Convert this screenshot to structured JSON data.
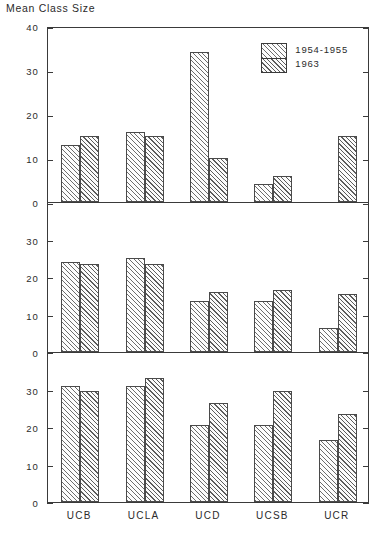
{
  "chart_data": {
    "type": "bar",
    "title": "Mean Class Size",
    "xlabel": "",
    "ylabel": "Mean Class Size",
    "grid": false,
    "legend_position": "top-right (panel 1)",
    "categories": [
      "UCB",
      "UCLA",
      "UCD",
      "UCSB",
      "UCR"
    ],
    "series_names": [
      "1954-1955",
      "1963"
    ],
    "panels": [
      {
        "name": "panel-1",
        "ylim": [
          0,
          40
        ],
        "yticks": [
          0,
          10,
          20,
          30,
          40
        ],
        "yticklabels": [
          "0",
          "10",
          "20",
          "30",
          "40"
        ],
        "series": [
          {
            "name": "1954-1955",
            "values": [
              13,
              16,
              34,
              4,
              null
            ]
          },
          {
            "name": "1963",
            "values": [
              15,
              15,
              10,
              6,
              15
            ]
          }
        ]
      },
      {
        "name": "panel-2",
        "ylim": [
          0,
          40
        ],
        "yticks": [
          0,
          10,
          20,
          30
        ],
        "yticklabels": [
          "0",
          "10",
          "20",
          "30"
        ],
        "series": [
          {
            "name": "1954-1955",
            "values": [
              24,
              25,
              13.5,
              13.5,
              6.5
            ]
          },
          {
            "name": "1963",
            "values": [
              23.5,
              23.5,
              16,
              16.5,
              15.5
            ]
          }
        ]
      },
      {
        "name": "panel-3",
        "ylim": [
          0,
          40
        ],
        "yticks": [
          0,
          10,
          20,
          30
        ],
        "yticklabels": [
          "0",
          "10",
          "20",
          "30"
        ],
        "series": [
          {
            "name": "1954-1955",
            "values": [
              31,
              31,
              20.5,
              20.5,
              16.5
            ]
          },
          {
            "name": "1963",
            "values": [
              29.5,
              33,
              26.5,
              29.5,
              23.5
            ]
          }
        ]
      }
    ]
  },
  "legend": {
    "entries": [
      {
        "label": "1954-1955",
        "hatch": "hatch-a"
      },
      {
        "label": "1963",
        "hatch": "hatch-b"
      }
    ]
  },
  "colors": {
    "axis": "#3a3a3a",
    "text": "#2b2b2b",
    "hatch_a": "#6d6d6d",
    "hatch_b": "#5c5c5c",
    "background": "#ffffff"
  }
}
